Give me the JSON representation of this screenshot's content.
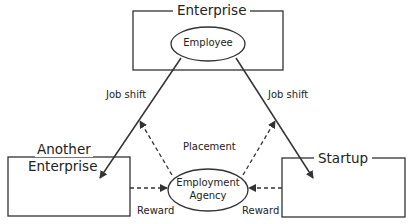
{
  "diagram": {
    "nodes": {
      "enterprise": {
        "label": "Enterprise"
      },
      "employee": {
        "label": "Employee"
      },
      "another_enterprise": {
        "label_line1": "Another",
        "label_line2": "Enterprise"
      },
      "startup": {
        "label": "Startup"
      },
      "agency": {
        "label_line1": "Employment",
        "label_line2": "Agency"
      }
    },
    "edges": {
      "job_shift_left": "Job shift",
      "job_shift_right": "Job shift",
      "placement": "Placement",
      "reward_left": "Reward",
      "reward_right": "Reward"
    },
    "colors": {
      "line": "#333333",
      "background": "#ffffff"
    }
  }
}
